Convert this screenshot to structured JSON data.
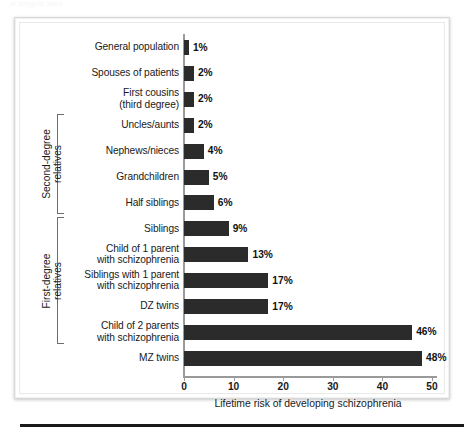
{
  "figure": {
    "bleed_text": "of dizygotic twins",
    "axis_title": "Lifetime risk of developing schizophrenia",
    "bar_color": "#2b2b2b",
    "axis_color": "#9a9a9a",
    "bracket_color": "#6f6f6f"
  },
  "groups": [
    {
      "label": "Second-degree\nrelatives",
      "first_row": 3,
      "last_row": 6
    },
    {
      "label": "First-degree\nrelatives",
      "first_row": 7,
      "last_row": 11
    }
  ],
  "chart_data": {
    "type": "bar",
    "orientation": "horizontal",
    "title": "",
    "xlabel": "Lifetime risk of developing schizophrenia",
    "ylabel": "",
    "xlim": [
      0,
      50
    ],
    "xticks": [
      0,
      10,
      20,
      30,
      40,
      50
    ],
    "xtick_labels": [
      "0",
      "10",
      "20",
      "30",
      "40",
      "50"
    ],
    "grid": false,
    "legend": "none",
    "categories": [
      "General population",
      "Spouses of patients",
      "First cousins\n(third degree)",
      "Uncles/aunts",
      "Nephews/nieces",
      "Grandchildren",
      "Half siblings",
      "Siblings",
      "Child of 1 parent\nwith schizophrenia",
      "Siblings with 1 parent\nwith schizophrenia",
      "DZ twins",
      "Child of 2 parents\nwith schizophrenia",
      "MZ twins"
    ],
    "values": [
      1,
      2,
      2,
      2,
      4,
      5,
      6,
      9,
      13,
      17,
      17,
      46,
      48
    ],
    "value_labels": [
      "1%",
      "2%",
      "2%",
      "2%",
      "4%",
      "5%",
      "6%",
      "9%",
      "13%",
      "17%",
      "17%",
      "46%",
      "48%"
    ]
  }
}
